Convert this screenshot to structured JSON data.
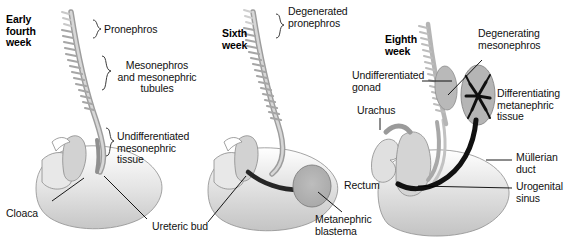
{
  "figure": {
    "type": "anatomical-diagram",
    "background_color": "#ffffff",
    "text_color": "#111111",
    "tissue_fill": "#c9c9c9",
    "tissue_fill_light": "#dcdcdc",
    "duct_dark": "#1a1a1a"
  },
  "panels": [
    {
      "id": "panel-early-fourth-week",
      "stage_title": "Early\nfourth\nweek",
      "labels": [
        {
          "id": "pronephros",
          "text": "Pronephros",
          "connector": "brace"
        },
        {
          "id": "mesonephros-tubules",
          "text": "Mesonephros\nand mesonephric\ntubules",
          "connector": "brace"
        },
        {
          "id": "undifferentiated-mesonephric-tissue",
          "text": "Undifferentiated\nmesonephric\ntissue",
          "connector": "brace"
        },
        {
          "id": "cloaca",
          "text": "Cloaca",
          "connector": "leader-line"
        },
        {
          "id": "ureteric-bud",
          "text": "Ureteric bud",
          "connector": "leader-line"
        }
      ]
    },
    {
      "id": "panel-sixth-week",
      "stage_title": "Sixth\nweek",
      "labels": [
        {
          "id": "degenerated-pronephros",
          "text": "Degenerated\npronephros",
          "connector": "brace"
        },
        {
          "id": "metanephric-blastema",
          "text": "Metanephric\nblastema",
          "connector": "leader-line"
        }
      ]
    },
    {
      "id": "panel-eighth-week",
      "stage_title": "Eighth\nweek",
      "labels": [
        {
          "id": "degenerating-mesonephros",
          "text": "Degenerating\nmesonephros",
          "connector": "leader-line"
        },
        {
          "id": "undifferentiated-gonad",
          "text": "Undifferentiated\ngonad",
          "connector": "leader-line"
        },
        {
          "id": "differentiating-metanephric-tissue",
          "text": "Differentiating\nmetanephric\ntissue",
          "connector": "none"
        },
        {
          "id": "urachus",
          "text": "Urachus",
          "connector": "leader-line"
        },
        {
          "id": "rectum",
          "text": "Rectum",
          "connector": "none"
        },
        {
          "id": "mullerian-duct",
          "text": "Müllerian\nduct",
          "connector": "leader-line"
        },
        {
          "id": "urogenital-sinus",
          "text": "Urogenital\nsinus",
          "connector": "leader-line"
        }
      ]
    }
  ]
}
